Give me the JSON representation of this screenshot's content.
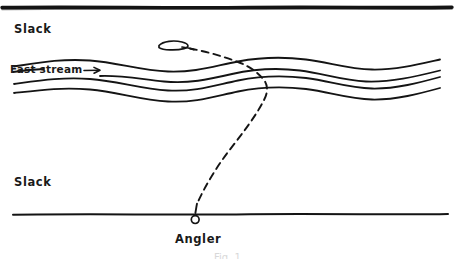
{
  "figure": {
    "background_color": "#ffffff",
    "ink_color": "#141414"
  },
  "labels": {
    "slack_upper": "Slack",
    "slack_lower": "Slack",
    "fast_stream": "Fast stream",
    "angler": "Angler",
    "caption_cut_off": "Fig. 1"
  },
  "elements": {
    "far_bank_line": "far-bank-line",
    "near_bank_line": "near-bank-line",
    "stream_lines_count": 4,
    "fly_marker": "fly-lure-oval",
    "angler_marker": "angler-position-circle",
    "fishing_line": "dashed-fishing-line",
    "flow_arrow": "flow-direction-arrow"
  },
  "annotations": {
    "flow_direction": "right",
    "angler_x": 195,
    "angler_y": 218,
    "fly_x": 175,
    "fly_y": 45
  }
}
